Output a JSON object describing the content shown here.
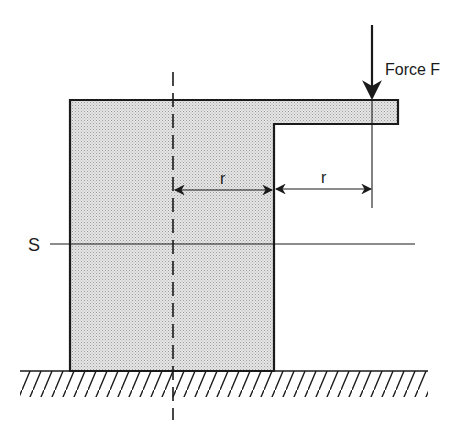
{
  "diagram": {
    "force_label": "Force F",
    "section_label": "S",
    "dim_label_left": "r",
    "dim_label_right": "r",
    "colors": {
      "stroke": "#1a1a1a",
      "fill_stipple_bg": "#e4e4e4",
      "fill_stipple_dot": "#9a9a9a",
      "background": "#ffffff"
    }
  }
}
